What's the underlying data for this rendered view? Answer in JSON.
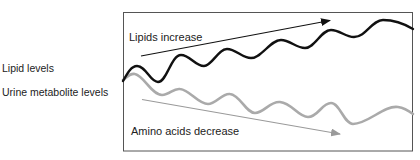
{
  "labels": {
    "lipid_levels": "Lipid levels",
    "urine_metabolite_levels": "Urine metabolite levels"
  },
  "annotations": {
    "lipids_increase": "Lipids increase",
    "amino_acids_decrease": "Amino acids decrease"
  },
  "series": [
    {
      "name": "Lipid levels",
      "color": "#111111",
      "trend": "increase",
      "description": "oscillating line trending upward"
    },
    {
      "name": "Urine metabolite levels",
      "color": "#aaaaaa",
      "trend": "decrease",
      "description": "oscillating line trending downward"
    }
  ],
  "colors": {
    "frame": "#555555",
    "lipid_line": "#111111",
    "lipid_arrow": "#111111",
    "urine_line": "#aaaaaa",
    "urine_arrow": "#9a9a9a",
    "text": "#222222"
  }
}
